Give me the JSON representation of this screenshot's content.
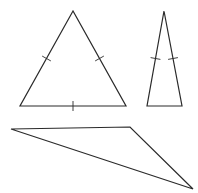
{
  "diagram": {
    "title": "",
    "stroke_color": "#2a2a2a",
    "background": "#ffffff",
    "shapes": [
      {
        "name": "equilateral-triangle",
        "type": "triangle",
        "vertices": [
          [
            73,
            11
          ],
          [
            20,
            106
          ],
          [
            126,
            106
          ]
        ],
        "tick_marks": 3,
        "ticks": [
          {
            "mid": [
              46.5,
              58.5
            ],
            "dir": [
              0.87,
              0.49
            ]
          },
          {
            "mid": [
              99.5,
              58.5
            ],
            "dir": [
              -0.87,
              0.49
            ]
          },
          {
            "mid": [
              73,
              106
            ],
            "dir": [
              0,
              1
            ]
          }
        ]
      },
      {
        "name": "isosceles-triangle",
        "type": "triangle",
        "vertices": [
          [
            164,
            11
          ],
          [
            147,
            106
          ],
          [
            182,
            106
          ]
        ],
        "tick_marks": 2,
        "ticks": [
          {
            "mid": [
              155.5,
              58.5
            ],
            "dir": [
              0.98,
              0.18
            ]
          },
          {
            "mid": [
              173,
              58.5
            ],
            "dir": [
              -0.98,
              0.18
            ]
          }
        ]
      },
      {
        "name": "scalene-obtuse-triangle",
        "type": "triangle",
        "vertices": [
          [
            11,
            129
          ],
          [
            130,
            127
          ],
          [
            193,
            189
          ]
        ],
        "tick_marks": 0,
        "ticks": []
      }
    ]
  }
}
